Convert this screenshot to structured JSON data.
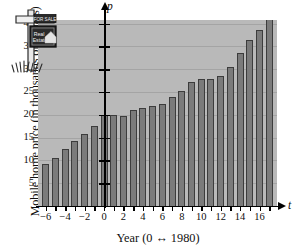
{
  "chart_data": {
    "type": "bar",
    "title": "",
    "subtitle": "",
    "xlabel": "Year (0 ↔ 1980)",
    "ylabel": "Mobile home price (in thousands of dollars)",
    "x_variable": "t",
    "y_variable": "p",
    "grid": true,
    "legend": null,
    "xlim": [
      -6.8,
      17.8
    ],
    "ylim": [
      0,
      43
    ],
    "x_ticks": [
      -6,
      -4,
      -2,
      0,
      2,
      4,
      6,
      8,
      10,
      12,
      14,
      16
    ],
    "x_tick_labels": [
      "−6",
      "−4",
      "−2",
      "0",
      "2",
      "4",
      "6",
      "8",
      "10",
      "12",
      "14",
      "16"
    ],
    "y_ticks": [
      5,
      10,
      15,
      20,
      25,
      30,
      35,
      40
    ],
    "y_tick_labels": [
      "5",
      "10",
      "15",
      "20",
      "25",
      "30",
      "35",
      "40"
    ],
    "x": [
      -6,
      -5,
      -4,
      -3,
      -2,
      -1,
      0,
      1,
      2,
      3,
      4,
      5,
      6,
      7,
      8,
      9,
      10,
      11,
      12,
      13,
      14,
      15,
      16,
      17
    ],
    "values": [
      9.3,
      10.6,
      12.4,
      14.3,
      15.8,
      17.5,
      20.0,
      19.9,
      19.7,
      21.0,
      21.5,
      21.9,
      22.4,
      23.8,
      25.2,
      27.2,
      27.9,
      27.8,
      28.4,
      30.5,
      33.6,
      36.3,
      38.5,
      41.2
    ],
    "bar_color": "#7b7b7b",
    "bar_edge_color": "#3c3c3c",
    "panel_color": "#b9b9b9",
    "grid_color": "#a4a4a4",
    "axis_color": "#000000"
  },
  "annotation": {
    "sign_top_text": "FOR SALE",
    "sign_main_text_line1": "Real",
    "sign_main_text_line2": "Estate",
    "sign_name": "real-estate-sign-illustration"
  }
}
